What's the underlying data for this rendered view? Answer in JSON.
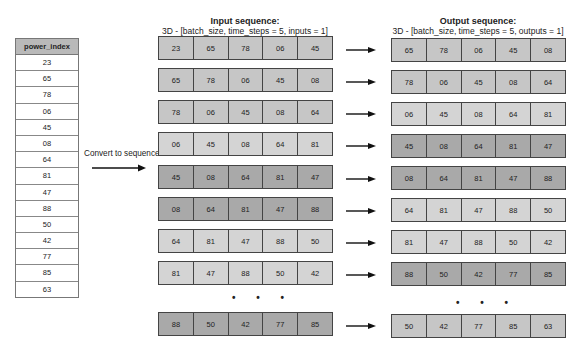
{
  "table": {
    "header": "power_index",
    "values": [
      "23",
      "65",
      "78",
      "06",
      "45",
      "08",
      "64",
      "81",
      "47",
      "88",
      "50",
      "42",
      "77",
      "85",
      "63"
    ]
  },
  "convert": {
    "label": "Convert to sequence"
  },
  "input": {
    "title": "Input sequence:",
    "subtitle": "3D - [batch_size, time_steps = 5, inputs = 1]",
    "rows": [
      {
        "shade": "mid",
        "values": [
          "23",
          "65",
          "78",
          "06",
          "45"
        ]
      },
      {
        "shade": "mid",
        "values": [
          "65",
          "78",
          "06",
          "45",
          "08"
        ]
      },
      {
        "shade": "mid",
        "values": [
          "78",
          "06",
          "45",
          "08",
          "64"
        ]
      },
      {
        "shade": "light",
        "values": [
          "06",
          "45",
          "08",
          "64",
          "81"
        ]
      },
      {
        "shade": "dark",
        "values": [
          "45",
          "08",
          "64",
          "81",
          "47"
        ]
      },
      {
        "shade": "dark",
        "values": [
          "08",
          "64",
          "81",
          "47",
          "88"
        ]
      },
      {
        "shade": "light",
        "values": [
          "64",
          "81",
          "47",
          "88",
          "50"
        ]
      },
      {
        "shade": "light",
        "values": [
          "81",
          "47",
          "88",
          "50",
          "42"
        ]
      },
      {
        "shade": "dark",
        "values": [
          "88",
          "50",
          "42",
          "77",
          "85"
        ]
      }
    ],
    "ellipsis": "• • •"
  },
  "output": {
    "title": "Output sequence:",
    "subtitle": "3D - [batch_size, time_steps = 5, outputs = 1]",
    "rows": [
      {
        "shade": "mid",
        "values": [
          "65",
          "78",
          "06",
          "45",
          "08"
        ]
      },
      {
        "shade": "mid",
        "values": [
          "78",
          "06",
          "45",
          "08",
          "64"
        ]
      },
      {
        "shade": "light",
        "values": [
          "06",
          "45",
          "08",
          "64",
          "81"
        ]
      },
      {
        "shade": "dark",
        "values": [
          "45",
          "08",
          "64",
          "81",
          "47"
        ]
      },
      {
        "shade": "dark",
        "values": [
          "08",
          "64",
          "81",
          "47",
          "88"
        ]
      },
      {
        "shade": "light",
        "values": [
          "64",
          "81",
          "47",
          "88",
          "50"
        ]
      },
      {
        "shade": "light",
        "values": [
          "81",
          "47",
          "88",
          "50",
          "42"
        ]
      },
      {
        "shade": "dark",
        "values": [
          "88",
          "50",
          "42",
          "77",
          "85"
        ]
      },
      {
        "shade": "mid",
        "values": [
          "50",
          "42",
          "77",
          "85",
          "63"
        ]
      }
    ],
    "ellipsis": "• • •"
  }
}
